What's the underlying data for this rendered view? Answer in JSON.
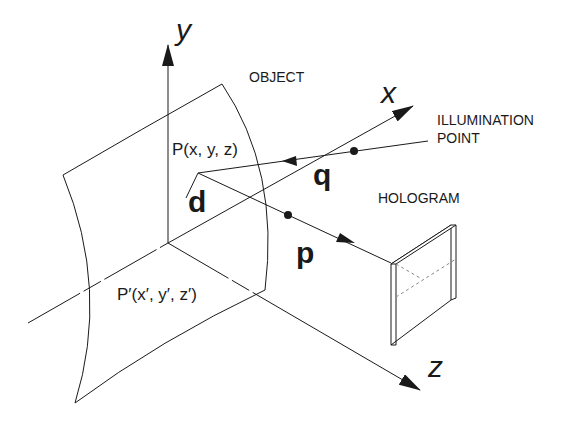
{
  "diagram": {
    "type": "hologram recording geometry",
    "axes": {
      "x": {
        "label": "x"
      },
      "y": {
        "label": "y"
      },
      "z": {
        "label": "z"
      }
    },
    "labels": {
      "object": "OBJECT",
      "illumination_line1": "ILLUMINATION",
      "illumination_line2": "POINT",
      "hologram": "HOLOGRAM",
      "point_p": "P(x, y, z)",
      "point_p_prime": "P′(x′, y′, z′)",
      "vector_d": "d",
      "vector_q": "q",
      "vector_p": "p"
    },
    "colors": {
      "line": "#1a1a1a",
      "background": "#ffffff"
    }
  }
}
